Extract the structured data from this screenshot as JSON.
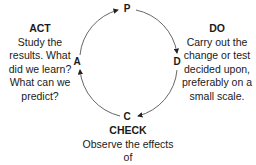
{
  "cycle": {
    "nodes": {
      "p": "P",
      "d": "D",
      "c": "C",
      "a": "A"
    },
    "direction": "clockwise",
    "line_color": "#555555"
  },
  "act": {
    "title": "ACT",
    "lines": [
      "Study the",
      "results. What",
      "did we learn?",
      "What can we",
      "predict?"
    ]
  },
  "do": {
    "title": "DO",
    "lines": [
      "Carry out the",
      "change or test",
      "decided upon,",
      "preferably on a",
      "small scale."
    ]
  },
  "check": {
    "title": "CHECK",
    "lines": [
      "Observe the effects of",
      "the change or test."
    ]
  }
}
